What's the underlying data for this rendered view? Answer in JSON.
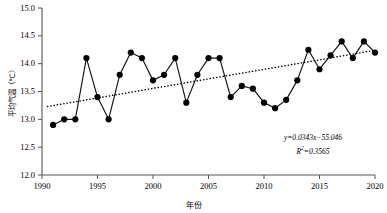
{
  "chart_data": {
    "type": "line",
    "title": "",
    "subtitle": "",
    "xlabel": "年份",
    "ylabel": "平均气温（℃）",
    "xlim": [
      1990,
      2020
    ],
    "ylim": [
      12.0,
      15.0
    ],
    "grid": false,
    "legend": null,
    "x_ticks": [
      "1990",
      "1995",
      "2000",
      "2005",
      "2010",
      "2015",
      "2020"
    ],
    "x_tick_values": [
      1990,
      1995,
      2000,
      2005,
      2010,
      2015,
      2020
    ],
    "y_ticks": [
      "12.0",
      "12.5",
      "13.0",
      "13.5",
      "14.0",
      "14.5",
      "15.0"
    ],
    "y_tick_values": [
      12.0,
      12.5,
      13.0,
      13.5,
      14.0,
      14.5,
      15.0
    ],
    "x": [
      1991,
      1992,
      1993,
      1994,
      1995,
      1996,
      1997,
      1998,
      1999,
      2000,
      2001,
      2002,
      2003,
      2004,
      2005,
      2006,
      2007,
      2008,
      2009,
      2010,
      2011,
      2012,
      2013,
      2014,
      2015,
      2016,
      2017,
      2018,
      2019,
      2020
    ],
    "series": [
      {
        "name": "平均气温",
        "marker": "circle-filled",
        "color": "#000000",
        "values": [
          12.9,
          13.0,
          13.0,
          14.1,
          13.4,
          13.0,
          13.8,
          14.2,
          14.1,
          13.7,
          13.8,
          14.1,
          13.3,
          13.8,
          14.1,
          14.1,
          13.4,
          13.6,
          13.55,
          13.3,
          13.2,
          13.35,
          13.7,
          14.25,
          13.9,
          14.15,
          14.4,
          14.1,
          14.4,
          14.2
        ]
      }
    ],
    "trendline": {
      "type": "linear-dotted",
      "color": "#000000",
      "equation": "y=0.0343x−55.046",
      "r_squared_label": "R²=0.3565",
      "slope": 0.0343,
      "intercept": -55.046,
      "r_squared": 0.3565,
      "x_start": 1990.5,
      "x_end": 2020.0,
      "y_start": 13.23,
      "y_end": 14.24
    },
    "annotations": [
      {
        "text": "y=0.0343x−55.046"
      },
      {
        "text": "R²=0.3565"
      }
    ]
  },
  "axes": {
    "y_title": "平均气温（℃）",
    "x_title": "年份"
  },
  "equation": {
    "line1": "y=0.0343x−55.046",
    "line2_prefix": "R",
    "line2_sup": "2",
    "line2_suffix": "=0.3565"
  }
}
